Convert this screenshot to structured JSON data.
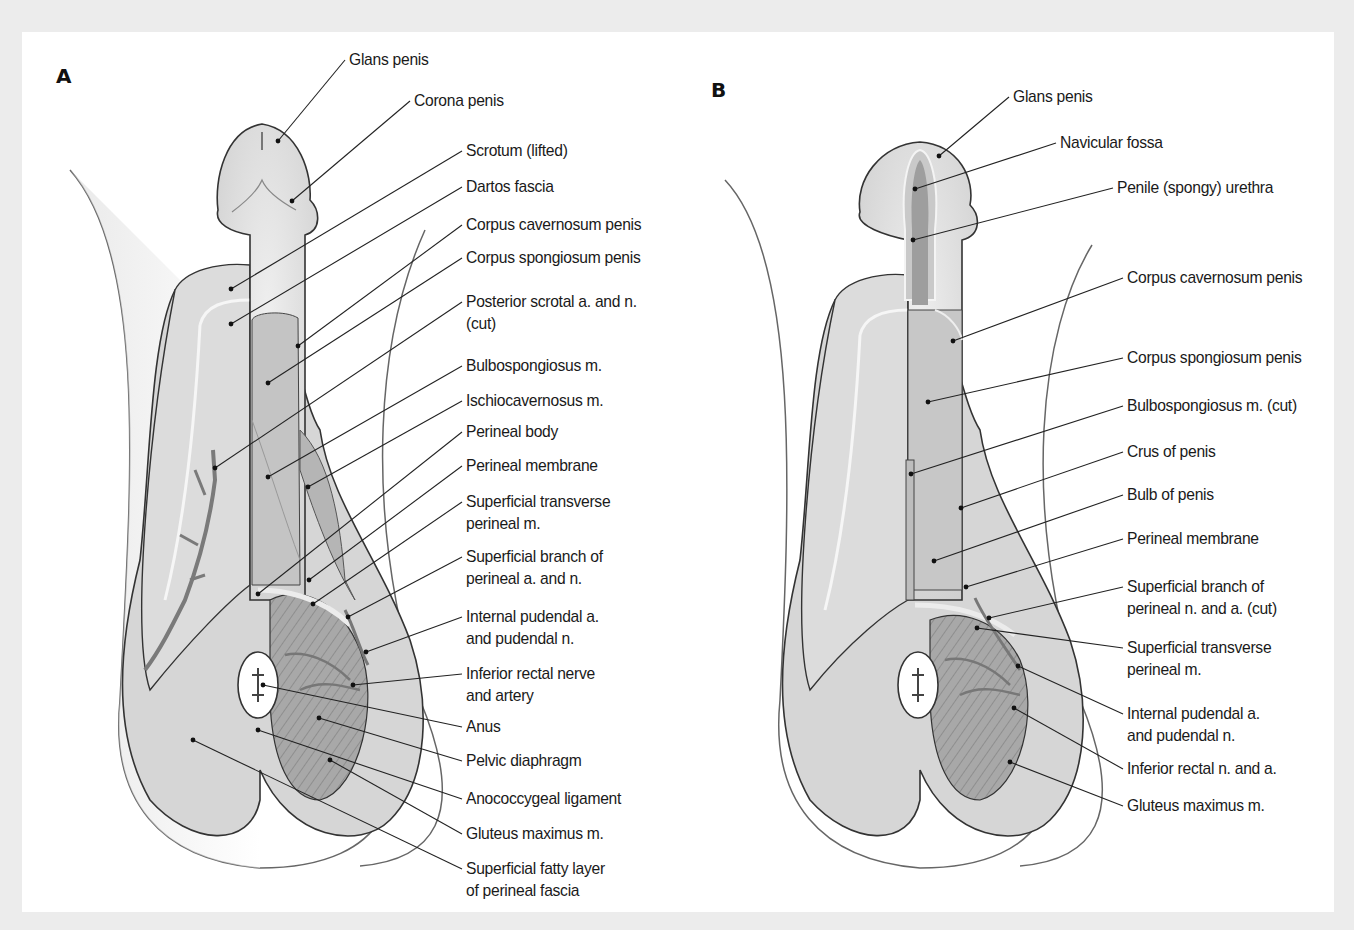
{
  "figure": {
    "panel_a": {
      "letter": "A",
      "labels": [
        {
          "id": "glans-penis",
          "text": "Glans penis",
          "x": 349,
          "y": 49,
          "lines": 1,
          "ax": 278,
          "ay": 141,
          "lx": 345,
          "ly": 60
        },
        {
          "id": "corona-penis",
          "text": "Corona penis",
          "x": 414,
          "y": 90,
          "lines": 1,
          "ax": 292,
          "ay": 201,
          "lx": 410,
          "ly": 101
        },
        {
          "id": "scrotum-lifted",
          "text": "Scrotum (lifted)",
          "x": 466,
          "y": 140,
          "lines": 1,
          "ax": 231,
          "ay": 289,
          "lx": 462,
          "ly": 151
        },
        {
          "id": "dartos-fascia",
          "text": "Dartos fascia",
          "x": 466,
          "y": 176,
          "lines": 1,
          "ax": 231,
          "ay": 324,
          "lx": 462,
          "ly": 187
        },
        {
          "id": "corpus-cavernosum",
          "text": "Corpus cavernosum penis",
          "x": 466,
          "y": 214,
          "lines": 1,
          "ax": 298,
          "ay": 346,
          "lx": 462,
          "ly": 225
        },
        {
          "id": "corpus-spongiosum",
          "text": "Corpus spongiosum penis",
          "x": 466,
          "y": 247,
          "lines": 1,
          "ax": 268,
          "ay": 383,
          "lx": 462,
          "ly": 258
        },
        {
          "id": "posterior-scrotal",
          "text": "Posterior scrotal a. and n.",
          "text2": "(cut)",
          "x": 466,
          "y": 291,
          "lines": 2,
          "ax": 215,
          "ay": 468,
          "lx": 462,
          "ly": 302
        },
        {
          "id": "bulbospongiosus",
          "text": "Bulbospongiosus m.",
          "x": 466,
          "y": 355,
          "lines": 1,
          "ax": 268,
          "ay": 477,
          "lx": 462,
          "ly": 366
        },
        {
          "id": "ischiocavernosus",
          "text": "Ischiocavernosus m.",
          "x": 466,
          "y": 390,
          "lines": 1,
          "ax": 308,
          "ay": 487,
          "lx": 462,
          "ly": 401
        },
        {
          "id": "perineal-body",
          "text": "Perineal body",
          "x": 466,
          "y": 421,
          "lines": 1,
          "ax": 258,
          "ay": 594,
          "lx": 462,
          "ly": 432
        },
        {
          "id": "perineal-membrane",
          "text": "Perineal membrane",
          "x": 466,
          "y": 455,
          "lines": 1,
          "ax": 309,
          "ay": 580,
          "lx": 462,
          "ly": 466
        },
        {
          "id": "superficial-transverse",
          "text": "Superficial transverse",
          "text2": "perineal m.",
          "x": 466,
          "y": 491,
          "lines": 2,
          "ax": 313,
          "ay": 604,
          "lx": 462,
          "ly": 502
        },
        {
          "id": "superficial-branch",
          "text": "Superficial branch of",
          "text2": "perineal a. and n.",
          "x": 466,
          "y": 546,
          "lines": 2,
          "ax": 348,
          "ay": 617,
          "lx": 462,
          "ly": 557
        },
        {
          "id": "internal-pudendal",
          "text": "Internal pudendal a.",
          "text2": "and pudendal n.",
          "x": 466,
          "y": 606,
          "lines": 2,
          "ax": 366,
          "ay": 652,
          "lx": 462,
          "ly": 617
        },
        {
          "id": "inferior-rectal",
          "text": "Inferior rectal nerve",
          "text2": "and artery",
          "x": 466,
          "y": 663,
          "lines": 2,
          "ax": 353,
          "ay": 685,
          "lx": 462,
          "ly": 674
        },
        {
          "id": "anus",
          "text": "Anus",
          "x": 466,
          "y": 716,
          "lines": 1,
          "ax": 263,
          "ay": 685,
          "lx": 462,
          "ly": 727
        },
        {
          "id": "pelvic-diaphragm",
          "text": "Pelvic diaphragm",
          "x": 466,
          "y": 750,
          "lines": 1,
          "ax": 319,
          "ay": 718,
          "lx": 462,
          "ly": 761
        },
        {
          "id": "anococcygeal-ligament",
          "text": "Anococcygeal ligament",
          "x": 466,
          "y": 788,
          "lines": 1,
          "ax": 258,
          "ay": 730,
          "lx": 462,
          "ly": 799
        },
        {
          "id": "gluteus-maximus",
          "text": "Gluteus maximus m.",
          "x": 466,
          "y": 823,
          "lines": 1,
          "ax": 330,
          "ay": 760,
          "lx": 462,
          "ly": 834
        },
        {
          "id": "superficial-fatty-layer",
          "text": "Superficial fatty layer",
          "text2": "of perineal fascia",
          "x": 466,
          "y": 858,
          "lines": 2,
          "ax": 193,
          "ay": 740,
          "lx": 462,
          "ly": 869
        }
      ]
    },
    "panel_b": {
      "letter": "B",
      "labels": [
        {
          "id": "glans-penis-b",
          "text": "Glans penis",
          "x": 1013,
          "y": 86,
          "lines": 1,
          "ax": 939,
          "ay": 156,
          "lx": 1009,
          "ly": 97
        },
        {
          "id": "navicular-fossa",
          "text": "Navicular fossa",
          "x": 1060,
          "y": 132,
          "lines": 1,
          "ax": 915,
          "ay": 189,
          "lx": 1056,
          "ly": 143
        },
        {
          "id": "penile-urethra",
          "text": "Penile (spongy) urethra",
          "x": 1117,
          "y": 177,
          "lines": 1,
          "ax": 913,
          "ay": 240,
          "lx": 1113,
          "ly": 188
        },
        {
          "id": "corpus-cavernosum-b",
          "text": "Corpus cavernosum penis",
          "x": 1127,
          "y": 267,
          "lines": 1,
          "ax": 953,
          "ay": 341,
          "lx": 1123,
          "ly": 278
        },
        {
          "id": "corpus-spongiosum-b",
          "text": "Corpus spongiosum penis",
          "x": 1127,
          "y": 347,
          "lines": 1,
          "ax": 928,
          "ay": 402,
          "lx": 1123,
          "ly": 358
        },
        {
          "id": "bulbospongiosus-cut",
          "text": "Bulbospongiosus m. (cut)",
          "x": 1127,
          "y": 395,
          "lines": 1,
          "ax": 911,
          "ay": 474,
          "lx": 1123,
          "ly": 406
        },
        {
          "id": "crus-of-penis",
          "text": "Crus of penis",
          "x": 1127,
          "y": 441,
          "lines": 1,
          "ax": 961,
          "ay": 508,
          "lx": 1123,
          "ly": 452
        },
        {
          "id": "bulb-of-penis",
          "text": "Bulb of penis",
          "x": 1127,
          "y": 484,
          "lines": 1,
          "ax": 934,
          "ay": 561,
          "lx": 1123,
          "ly": 495
        },
        {
          "id": "perineal-membrane-b",
          "text": "Perineal membrane",
          "x": 1127,
          "y": 528,
          "lines": 1,
          "ax": 966,
          "ay": 587,
          "lx": 1123,
          "ly": 539
        },
        {
          "id": "superficial-branch-b",
          "text": "Superficial branch of",
          "text2": "perineal n. and a. (cut)",
          "x": 1127,
          "y": 576,
          "lines": 2,
          "ax": 989,
          "ay": 618,
          "lx": 1123,
          "ly": 587
        },
        {
          "id": "superficial-transverse-b",
          "text": "Superficial transverse",
          "text2": "perineal m.",
          "x": 1127,
          "y": 637,
          "lines": 2,
          "ax": 977,
          "ay": 628,
          "lx": 1123,
          "ly": 648
        },
        {
          "id": "internal-pudendal-b",
          "text": "Internal pudendal a.",
          "text2": "and pudendal n.",
          "x": 1127,
          "y": 703,
          "lines": 2,
          "ax": 1018,
          "ay": 666,
          "lx": 1123,
          "ly": 714
        },
        {
          "id": "inferior-rectal-b",
          "text": "Inferior rectal n. and a.",
          "x": 1127,
          "y": 758,
          "lines": 1,
          "ax": 1014,
          "ay": 708,
          "lx": 1123,
          "ly": 769
        },
        {
          "id": "gluteus-maximus-b",
          "text": "Gluteus maximus m.",
          "x": 1127,
          "y": 795,
          "lines": 1,
          "ax": 1010,
          "ay": 762,
          "lx": 1123,
          "ly": 806
        }
      ]
    },
    "colors": {
      "background": "#ececec",
      "card": "#ffffff",
      "tissue_light": "#e2e2e2",
      "tissue_mid": "#c9c9c9",
      "tissue_dark": "#a9a9a9",
      "vessel": "#7a7a7a",
      "outline": "#333333",
      "label_text": "#1a1a1a"
    }
  }
}
